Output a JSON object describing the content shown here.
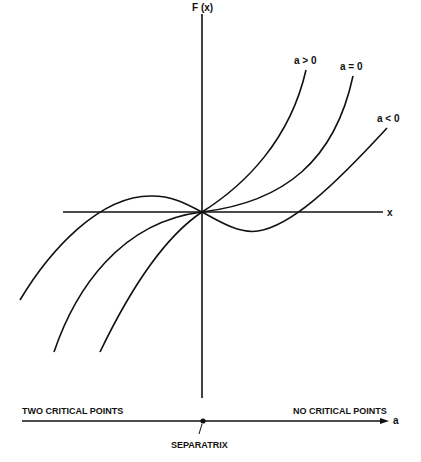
{
  "figure": {
    "y_axis_label": "F (x)",
    "x_axis_label": "x",
    "curves": [
      {
        "id": "a_pos",
        "label": "a > 0"
      },
      {
        "id": "a_zero",
        "label": "a = 0"
      },
      {
        "id": "a_neg",
        "label": "a < 0"
      }
    ]
  },
  "parameter_axis": {
    "label": "a",
    "left_region": "TWO CRITICAL POINTS",
    "right_region": "NO CRITICAL POINTS",
    "point_label": "SEPARATRIX"
  },
  "colors": {
    "ink": "#111111",
    "background": "#ffffff"
  }
}
